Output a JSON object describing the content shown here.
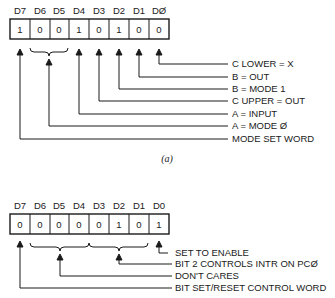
{
  "diagram_a": {
    "headers": [
      "D7",
      "D6",
      "D5",
      "D4",
      "D3",
      "D2",
      "D1",
      "DØ"
    ],
    "bits": [
      "1",
      "0",
      "0",
      "1",
      "0",
      "1",
      "0",
      "0"
    ],
    "labels": [
      "C LOWER = X",
      "B = OUT",
      "B = MODE 1",
      "C UPPER = OUT",
      "A = INPUT",
      "A = MODE Ø",
      "MODE SET WORD"
    ],
    "caption": "(a)"
  },
  "diagram_b": {
    "headers": [
      "D7",
      "D6",
      "D5",
      "D4",
      "D3",
      "D2",
      "D1",
      "D0"
    ],
    "bits": [
      "0",
      "0",
      "0",
      "0",
      "0",
      "1",
      "0",
      "1"
    ],
    "labels": [
      "SET TO ENABLE",
      "BIT 2 CONTROLS INTR ON PCØ",
      "DON'T CARES",
      "BIT SET/RESET CONTROL WORD"
    ]
  }
}
